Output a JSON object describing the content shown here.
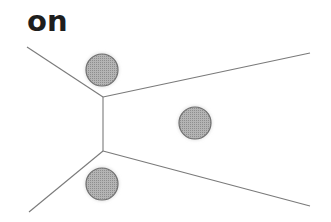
{
  "title": "on",
  "colors": {
    "background": "#ffffff",
    "line": "#7a7a7a",
    "circle_fill": "#a8a8a8",
    "circle_stroke": "#6f6f6f",
    "title": "#1e1e1e"
  },
  "diagram": {
    "vertices": [
      {
        "id": "v1",
        "x": 103,
        "y": 97
      },
      {
        "id": "v2",
        "x": 103,
        "y": 151
      }
    ],
    "edges": [
      {
        "from": [
          27,
          47
        ],
        "to": [
          103,
          97
        ]
      },
      {
        "from": [
          103,
          97
        ],
        "to": [
          310,
          53
        ]
      },
      {
        "from": [
          103,
          97
        ],
        "to": [
          103,
          151
        ]
      },
      {
        "from": [
          103,
          151
        ],
        "to": [
          29,
          212
        ]
      },
      {
        "from": [
          103,
          151
        ],
        "to": [
          310,
          206
        ]
      }
    ],
    "points": [
      {
        "id": "site-top",
        "cx": 102,
        "cy": 70,
        "r": 16
      },
      {
        "id": "site-right",
        "cx": 195,
        "cy": 123,
        "r": 16
      },
      {
        "id": "site-bottom",
        "cx": 102,
        "cy": 184,
        "r": 16
      }
    ]
  }
}
